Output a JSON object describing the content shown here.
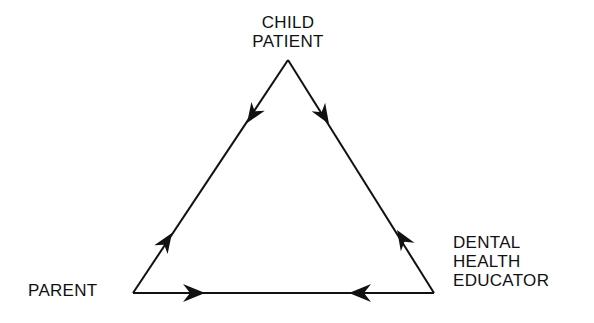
{
  "diagram": {
    "type": "triangle-relationship",
    "nodes": [
      {
        "id": "child",
        "label_lines": [
          "CHILD",
          "PATIENT"
        ]
      },
      {
        "id": "parent",
        "label_lines": [
          "PARENT"
        ]
      },
      {
        "id": "educator",
        "label_lines": [
          "DENTAL",
          "HEALTH",
          "EDUCATOR"
        ]
      }
    ],
    "edges": [
      {
        "from": "child",
        "to": "parent",
        "bidirectional": true
      },
      {
        "from": "child",
        "to": "educator",
        "bidirectional": true
      },
      {
        "from": "parent",
        "to": "educator",
        "bidirectional": true
      }
    ],
    "line_color": "#111111"
  }
}
